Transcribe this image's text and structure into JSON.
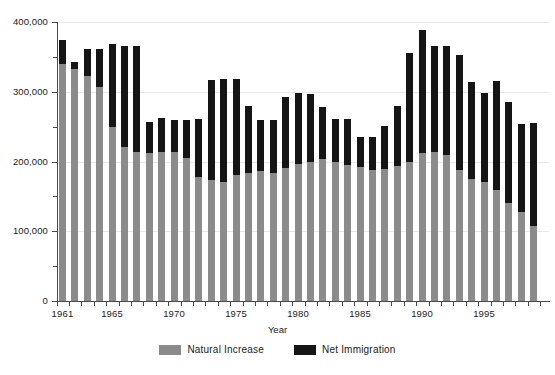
{
  "figure": {
    "clipped_title": "",
    "background": "#ffffff"
  },
  "axes": {
    "x_title": "Year",
    "y_major_labels": [
      "400,000",
      "300,000",
      "200,000",
      "100,000",
      "0"
    ],
    "x_tick_labels": [
      "1961",
      "1965",
      "1970",
      "1975",
      "1980",
      "1985",
      "1990",
      "1995"
    ]
  },
  "legend": {
    "position": "bottom-center",
    "items": [
      {
        "label": "Natural Increase",
        "color": "#8b8b8b"
      },
      {
        "label": "Net Immigration",
        "color": "#151515"
      }
    ]
  },
  "colors": {
    "natural_increase": "#8b8b8b",
    "net_immigration": "#151515",
    "axis": "#4a4a4a",
    "grid": "#e9e9e9"
  },
  "chart_data": {
    "type": "bar",
    "stacked": true,
    "title": "",
    "xlabel": "Year",
    "ylabel": "",
    "ylim": [
      0,
      400000
    ],
    "ytick_major_step": 100000,
    "ytick_minor_step": 50000,
    "grid": true,
    "legend_position": "bottom-center",
    "categories": [
      "1961",
      "1962",
      "1963",
      "1964",
      "1965",
      "1966",
      "1967",
      "1968",
      "1969",
      "1970",
      "1971",
      "1972",
      "1973",
      "1974",
      "1975",
      "1976",
      "1977",
      "1978",
      "1979",
      "1980",
      "1981",
      "1982",
      "1983",
      "1984",
      "1985",
      "1986",
      "1987",
      "1988",
      "1989",
      "1990",
      "1991",
      "1992",
      "1993",
      "1994",
      "1995",
      "1996",
      "1997",
      "1998",
      "1999"
    ],
    "series": [
      {
        "name": "Natural Increase",
        "color": "#8b8b8b",
        "values": [
          340000,
          332000,
          322000,
          307000,
          249000,
          221000,
          213000,
          212000,
          213000,
          214000,
          205000,
          178000,
          173000,
          171000,
          180000,
          183000,
          187000,
          184000,
          191000,
          197000,
          200000,
          203000,
          199000,
          195000,
          192000,
          188000,
          189000,
          194000,
          199000,
          212000,
          214000,
          209000,
          188000,
          175000,
          171000,
          159000,
          141000,
          127000,
          107000
        ]
      },
      {
        "name": "Net Immigration",
        "color": "#151515",
        "values": [
          34000,
          11000,
          39000,
          55000,
          120000,
          144000,
          152000,
          44000,
          49000,
          46000,
          55000,
          83000,
          144000,
          148000,
          138000,
          97000,
          73000,
          76000,
          102000,
          101000,
          97000,
          75000,
          62000,
          66000,
          43000,
          47000,
          62000,
          85000,
          156000,
          176000,
          152000,
          156000,
          165000,
          139000,
          127000,
          156000,
          145000,
          127000,
          148000
        ]
      }
    ],
    "totals": [
      374000,
      343000,
      361000,
      362000,
      369000,
      365000,
      365000,
      256000,
      262000,
      260000,
      260000,
      261000,
      317000,
      319000,
      318000,
      280000,
      260000,
      260000,
      293000,
      298000,
      297000,
      278000,
      261000,
      261000,
      235000,
      235000,
      251000,
      279000,
      355000,
      388000,
      366000,
      365000,
      353000,
      314000,
      298000,
      315000,
      286000,
      254000,
      255000
    ]
  }
}
